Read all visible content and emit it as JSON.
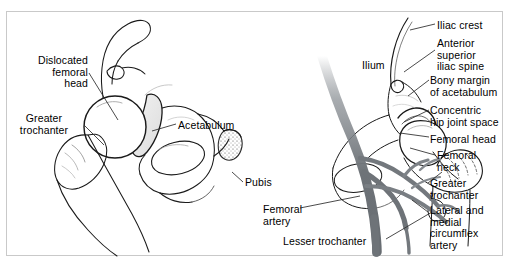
{
  "figure": {
    "domain_description": "Two-panel anatomical line illustration of the hip joint",
    "panels": [
      {
        "id": "left-panel",
        "name": "lateral-dislocated-hip-view",
        "description": "Lateral oblique view of pelvis and proximal femur with dislocated femoral head"
      },
      {
        "id": "right-panel",
        "name": "anterior-hip-vasculature-view",
        "description": "Anterior view of hip joint showing ilium, femoral head and circumflex arterial supply"
      }
    ]
  },
  "labels": {
    "left_panel": [
      {
        "key": "dislocated_femoral_head",
        "text": "Dislocated\nfemoral\nhead",
        "align": "right",
        "x": 14,
        "y": 55,
        "width": 74
      },
      {
        "key": "greater_trochanter_left",
        "text": "Greater\ntrochanter",
        "align": "center",
        "x": 5,
        "y": 113,
        "width": 78
      },
      {
        "key": "acetabulum",
        "text": "Acetabulum",
        "align": "left",
        "x": 178,
        "y": 120,
        "width": 72
      },
      {
        "key": "pubis",
        "text": "Pubis",
        "align": "left",
        "x": 245,
        "y": 177,
        "width": 40
      }
    ],
    "center_panel": [
      {
        "key": "ilium",
        "text": "Ilium",
        "align": "left",
        "x": 362,
        "y": 60,
        "width": 34
      },
      {
        "key": "femoral_artery",
        "text": "Femoral\nartery",
        "align": "left",
        "x": 263,
        "y": 204,
        "width": 54
      },
      {
        "key": "lesser_trochanter",
        "text": "Lesser trochanter",
        "align": "left",
        "x": 283,
        "y": 236,
        "width": 104
      }
    ],
    "right_panel": [
      {
        "key": "iliac_crest",
        "text": "Iliac crest",
        "align": "left",
        "x": 437,
        "y": 20,
        "width": 66
      },
      {
        "key": "anterior_superior_iliac_spine",
        "text": "Anterior\nsuperior\niliac spine",
        "align": "left",
        "x": 437,
        "y": 38,
        "width": 66
      },
      {
        "key": "bony_margin_of_acetabulum",
        "text": "Bony margin\nof acetabulum",
        "align": "left",
        "x": 430,
        "y": 75,
        "width": 78
      },
      {
        "key": "concentric_hip_joint_space",
        "text": "Concentric\nhip joint space",
        "align": "left",
        "x": 430,
        "y": 105,
        "width": 78
      },
      {
        "key": "femoral_head",
        "text": "Femoral head",
        "align": "left",
        "x": 430,
        "y": 134,
        "width": 78
      },
      {
        "key": "femoral_neck",
        "text": "Femoral\nneck",
        "align": "left",
        "x": 437,
        "y": 150,
        "width": 66
      },
      {
        "key": "greater_trochanter_right",
        "text": "Greater\ntrochanter",
        "align": "left",
        "x": 430,
        "y": 178,
        "width": 72
      },
      {
        "key": "lateral_and_medial_circumflex_artery",
        "text": "Lateral and\nmedial\ncircumflex\nartery",
        "align": "left",
        "x": 430,
        "y": 205,
        "width": 72
      }
    ]
  },
  "colors": {
    "background": "#ffffff",
    "frame_border": "#c9c9c9",
    "line_art": "#1a1a1a",
    "label_text": "#000000",
    "artery_gray": "#6e7378",
    "artery_light": "#8c9196",
    "bone_shade": "#e8e8e8",
    "bone_shade_dark": "#d6d6d6",
    "leader_line": "#2b2b2b"
  }
}
